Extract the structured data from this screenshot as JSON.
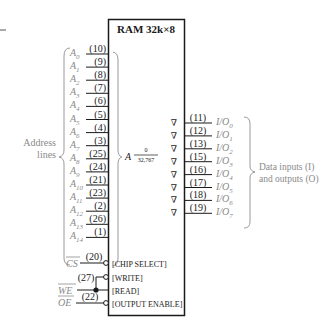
{
  "chip": {
    "title": "RAM 32k×8",
    "address_symbol": "A",
    "address_range_top": "0",
    "address_range_bottom": "32,767"
  },
  "address_group_label_line1": "Address",
  "address_group_label_line2": "lines",
  "address_pins": [
    {
      "name": "A",
      "sub": "0",
      "pin": "(10)"
    },
    {
      "name": "A",
      "sub": "1",
      "pin": "(9)"
    },
    {
      "name": "A",
      "sub": "2",
      "pin": "(8)"
    },
    {
      "name": "A",
      "sub": "3",
      "pin": "(7)"
    },
    {
      "name": "A",
      "sub": "4",
      "pin": "(6)"
    },
    {
      "name": "A",
      "sub": "5",
      "pin": "(5)"
    },
    {
      "name": "A",
      "sub": "6",
      "pin": "(4)"
    },
    {
      "name": "A",
      "sub": "7",
      "pin": "(3)"
    },
    {
      "name": "A",
      "sub": "8",
      "pin": "(25)"
    },
    {
      "name": "A",
      "sub": "9",
      "pin": "(24)"
    },
    {
      "name": "A",
      "sub": "10",
      "pin": "(21)"
    },
    {
      "name": "A",
      "sub": "11",
      "pin": "(23)"
    },
    {
      "name": "A",
      "sub": "12",
      "pin": "(2)"
    },
    {
      "name": "A",
      "sub": "13",
      "pin": "(26)"
    },
    {
      "name": "A",
      "sub": "14",
      "pin": "(1)"
    }
  ],
  "io_pins": [
    {
      "name": "I/O",
      "sub": "0",
      "pin": "(11)"
    },
    {
      "name": "I/O",
      "sub": "1",
      "pin": "(12)"
    },
    {
      "name": "I/O",
      "sub": "2",
      "pin": "(13)"
    },
    {
      "name": "I/O",
      "sub": "3",
      "pin": "(15)"
    },
    {
      "name": "I/O",
      "sub": "4",
      "pin": "(16)"
    },
    {
      "name": "I/O",
      "sub": "5",
      "pin": "(17)"
    },
    {
      "name": "I/O",
      "sub": "6",
      "pin": "(18)"
    },
    {
      "name": "I/O",
      "sub": "7",
      "pin": "(19)"
    }
  ],
  "io_group_label_line1": "Data inputs (I)",
  "io_group_label_line2": "and outputs (O)",
  "tristate_symbol": "∇",
  "control_pins": [
    {
      "signal": "CS",
      "pin": "(20)",
      "function": "[CHIP SELECT]"
    },
    {
      "signal": "",
      "pin": "(27)",
      "function": "[WRITE]"
    },
    {
      "signal": "WE",
      "pin": "",
      "function": "[READ]"
    },
    {
      "signal": "OE",
      "pin": "(22)",
      "function": "[OUTPUT ENABLE]"
    }
  ]
}
